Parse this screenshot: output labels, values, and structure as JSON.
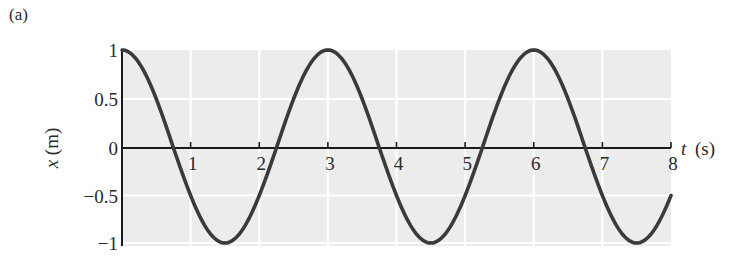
{
  "panel_label": "(a)",
  "chart_data": {
    "type": "line",
    "title": "",
    "panel_label": "(a)",
    "xlabel_var": "t",
    "xlabel_unit": "(s)",
    "ylabel": "x (m)",
    "xlim": [
      0,
      8
    ],
    "ylim": [
      -1,
      1
    ],
    "x_ticks": [
      1,
      2,
      3,
      4,
      5,
      6,
      7,
      8
    ],
    "x_tick_labels": [
      "1",
      "2",
      "3",
      "4",
      "5",
      "6",
      "7",
      "8"
    ],
    "y_ticks": [
      1,
      0.5,
      0,
      -0.5,
      -1
    ],
    "y_tick_labels": [
      "1",
      "0.5",
      "0",
      "−0.5",
      "−1"
    ],
    "grid": true,
    "legend": null,
    "function": "x = cos(2πt / 3)",
    "amplitude": 1,
    "period": 3,
    "series": [
      {
        "name": "x(t)",
        "x": [
          0,
          0.75,
          1.5,
          2.25,
          3,
          3.75,
          4.5,
          5.25,
          6,
          6.75,
          7.5,
          8
        ],
        "values": [
          1,
          0,
          -1,
          0,
          1,
          0,
          -1,
          0,
          1,
          0,
          -1,
          -0.5
        ]
      }
    ],
    "colors": {
      "curve": "#3a3a3a",
      "plot_background": "#ececec",
      "grid": "#ffffff",
      "axis": "#1a1a1a"
    }
  }
}
